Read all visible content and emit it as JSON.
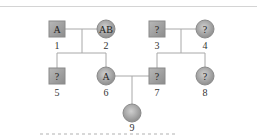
{
  "pedigree": {
    "individuals": [
      {
        "id": "1",
        "sex": "male",
        "label": "A",
        "number": "1",
        "x": 57,
        "y": 29
      },
      {
        "id": "2",
        "sex": "female",
        "label": "AB",
        "number": "2",
        "x": 106,
        "y": 29
      },
      {
        "id": "3",
        "sex": "male",
        "label": "?",
        "number": "3",
        "x": 157,
        "y": 29
      },
      {
        "id": "4",
        "sex": "female",
        "label": "?",
        "number": "4",
        "x": 205,
        "y": 29
      },
      {
        "id": "5",
        "sex": "male",
        "label": "?",
        "number": "5",
        "x": 57,
        "y": 76
      },
      {
        "id": "6",
        "sex": "female",
        "label": "A",
        "number": "6",
        "x": 106,
        "y": 76
      },
      {
        "id": "7",
        "sex": "male",
        "label": "?",
        "number": "7",
        "x": 157,
        "y": 76
      },
      {
        "id": "8",
        "sex": "female",
        "label": "?",
        "number": "8",
        "x": 205,
        "y": 76
      },
      {
        "id": "9",
        "sex": "female",
        "label": "",
        "number": "9",
        "x": 132,
        "y": 113
      }
    ],
    "colors": {
      "fill": "#9a9a9a",
      "stroke": "#8a8a8a",
      "line": "#a8a8a8"
    }
  }
}
